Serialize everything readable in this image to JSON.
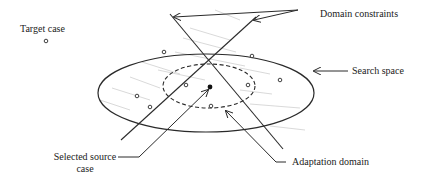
{
  "diagram": {
    "labels": {
      "target_case": "Target case",
      "domain_constraints": "Domain constraints",
      "search_space": "Search space",
      "selected_source_case_line1": "Selected  source",
      "selected_source_case_line2": "case",
      "adaptation_domain": "Adaptation  domain"
    },
    "colors": {
      "line": "#2a2a2a",
      "hatch": "#c8c8c8",
      "text": "#222222",
      "background": "#ffffff"
    },
    "shapes": {
      "search_space_ellipse": {
        "cx": 206,
        "cy": 93,
        "rx": 108,
        "ry": 39
      },
      "adaptation_domain_ellipse": {
        "cx": 209,
        "cy": 86,
        "rx": 46,
        "ry": 22,
        "style": "dashed"
      },
      "selected_source_case_point": {
        "x": 210,
        "y": 87,
        "filled": true
      },
      "case_points": [
        {
          "x": 46,
          "y": 41
        },
        {
          "x": 164,
          "y": 52
        },
        {
          "x": 252,
          "y": 56
        },
        {
          "x": 280,
          "y": 80
        },
        {
          "x": 186,
          "y": 85
        },
        {
          "x": 248,
          "y": 85
        },
        {
          "x": 137,
          "y": 96
        },
        {
          "x": 150,
          "y": 107
        },
        {
          "x": 211,
          "y": 106
        }
      ],
      "constraint_lines": [
        {
          "x1": 170,
          "y1": 14,
          "x2": 283,
          "y2": 149
        },
        {
          "x1": 256,
          "y1": 17,
          "x2": 121,
          "y2": 140
        }
      ]
    }
  }
}
